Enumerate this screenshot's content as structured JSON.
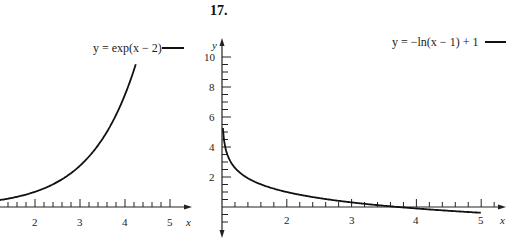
{
  "problem_number": "17.",
  "chart_data": [
    {
      "type": "line",
      "title": "",
      "legend": "y = exp(x − 2)",
      "xlabel": "x",
      "ylabel": "y",
      "x_ticks": [
        "2",
        "3",
        "4",
        "5"
      ],
      "xlim": [
        1,
        5.4
      ],
      "ylim": [
        0,
        10
      ],
      "grid": false,
      "series": [
        {
          "name": "y = exp(x − 2)",
          "x": [
            1.0,
            1.5,
            2.0,
            2.5,
            3.0,
            3.5,
            4.0,
            4.24
          ],
          "y": [
            0.37,
            0.61,
            1.0,
            1.65,
            2.72,
            4.48,
            7.39,
            9.4
          ]
        }
      ]
    },
    {
      "type": "line",
      "title": "",
      "legend": "y = −ln(x − 1) + 1",
      "xlabel": "x",
      "ylabel": "y",
      "x_ticks": [
        "2",
        "3",
        "4",
        "5"
      ],
      "y_ticks": [
        "2",
        "4",
        "6",
        "8",
        "10"
      ],
      "xlim": [
        1,
        5.4
      ],
      "ylim": [
        -1,
        10.5
      ],
      "grid": false,
      "series": [
        {
          "name": "y = −ln(x − 1) + 1",
          "x": [
            1.01,
            1.05,
            1.1,
            1.25,
            1.5,
            2.0,
            2.5,
            3.0,
            3.5,
            4.0,
            4.5,
            5.0
          ],
          "y": [
            5.6,
            4.0,
            3.3,
            2.39,
            1.69,
            1.0,
            0.59,
            0.31,
            0.08,
            -0.1,
            -0.25,
            -0.39
          ]
        }
      ]
    }
  ],
  "left": {
    "legend": "y = exp(x − 2)",
    "x_label": "x",
    "x_ticks": [
      "2",
      "3",
      "4",
      "5"
    ]
  },
  "right": {
    "legend": "y = −ln(x − 1) + 1",
    "x_label": "x",
    "y_label": "y",
    "x_ticks": [
      "2",
      "3",
      "4",
      "5"
    ],
    "y_ticks": [
      "10",
      "8",
      "6",
      "4",
      "2"
    ]
  }
}
